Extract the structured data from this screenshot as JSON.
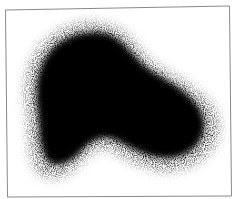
{
  "image": {
    "description": "Grainy black scintigraphy-style blob inside a thin gray rectangular frame",
    "background": "#ffffff",
    "frame_color": "#8a8a8a",
    "blob_color": "#000000"
  }
}
